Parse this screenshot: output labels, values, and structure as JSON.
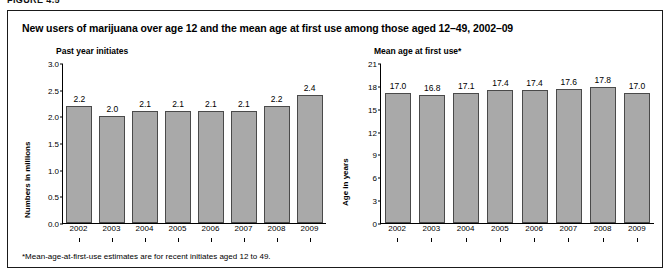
{
  "figure_label": "FIGURE 4.5",
  "title": "New users of marijuana over age 12 and the mean age at first use among those aged 12–49, 2002–09",
  "footnote": "*Mean-age-at-first-use estimates are for recent initiates aged 12 to 49.",
  "colors": {
    "bar_fill": "#a9a9a9",
    "bar_border": "#4a4a4a",
    "axis": "#000000",
    "frame": "#1a1a1a"
  },
  "chart_data": [
    {
      "type": "bar",
      "title": "Past year initiates",
      "xlabel": "",
      "ylabel": "Numbers in millions",
      "categories": [
        "2002",
        "2003",
        "2004",
        "2005",
        "2006",
        "2007",
        "2008",
        "2009"
      ],
      "values": [
        2.2,
        2.0,
        2.1,
        2.1,
        2.1,
        2.1,
        2.2,
        2.4
      ],
      "value_labels": [
        "2.2",
        "2.0",
        "2.1",
        "2.1",
        "2.1",
        "2.1",
        "2.2",
        "2.4"
      ],
      "ylim": [
        0.0,
        3.0
      ],
      "yticks": [
        0.0,
        0.5,
        1.0,
        1.5,
        2.0,
        2.5,
        3.0
      ],
      "ytick_labels": [
        "0.0",
        "0.5",
        "1.0",
        "1.5",
        "2.0",
        "2.5",
        "3.0"
      ],
      "grid": false,
      "legend": false
    },
    {
      "type": "bar",
      "title": "Mean age at first use*",
      "xlabel": "",
      "ylabel": "Age in years",
      "categories": [
        "2002",
        "2003",
        "2004",
        "2005",
        "2006",
        "2007",
        "2008",
        "2009"
      ],
      "values": [
        17.0,
        16.8,
        17.1,
        17.4,
        17.4,
        17.6,
        17.8,
        17.0
      ],
      "value_labels": [
        "17.0",
        "16.8",
        "17.1",
        "17.4",
        "17.4",
        "17.6",
        "17.8",
        "17.0"
      ],
      "ylim": [
        0,
        21
      ],
      "yticks": [
        0,
        3,
        6,
        9,
        12,
        15,
        18,
        21
      ],
      "ytick_labels": [
        "0",
        "3",
        "6",
        "9",
        "12",
        "15",
        "18",
        "21"
      ],
      "grid": false,
      "legend": false
    }
  ]
}
